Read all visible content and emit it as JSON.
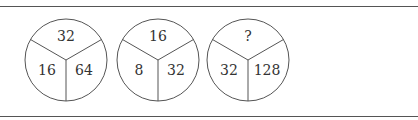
{
  "puzzle": {
    "type": "number-circle-sequence",
    "circles": [
      {
        "top": "32",
        "left": "16",
        "right": "64"
      },
      {
        "top": "16",
        "left": "8",
        "right": "32"
      },
      {
        "top": "?",
        "left": "32",
        "right": "128"
      }
    ]
  },
  "colors": {
    "stroke": "#555555",
    "text": "#333333",
    "background": "#ffffff"
  }
}
